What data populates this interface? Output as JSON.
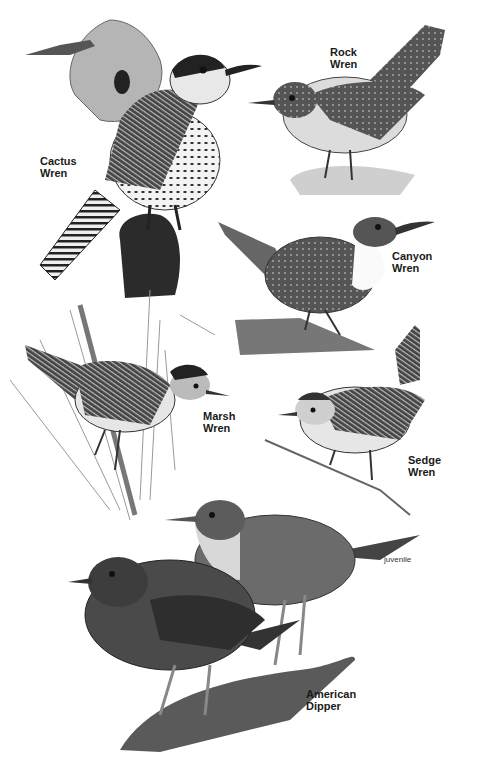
{
  "plate": {
    "background": "#ffffff",
    "birds": [
      {
        "id": "cactus-wren",
        "label": "Cactus\nWren"
      },
      {
        "id": "rock-wren",
        "label": "Rock\nWren"
      },
      {
        "id": "canyon-wren",
        "label": "Canyon\nWren"
      },
      {
        "id": "marsh-wren",
        "label": "Marsh\nWren"
      },
      {
        "id": "sedge-wren",
        "label": "Sedge\nWren"
      },
      {
        "id": "american-dipper",
        "label": "American\nDipper",
        "sublabel": "juvenile"
      }
    ]
  }
}
